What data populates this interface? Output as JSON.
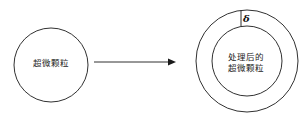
{
  "diagram": {
    "left_particle": {
      "label": "超微颗粒"
    },
    "arrow": {
      "name": "process-arrow"
    },
    "right_particle": {
      "label_line1": "处理后的",
      "label_line2": "超微颗粒",
      "coating_thickness_symbol": "δ"
    },
    "colors": {
      "stroke": "#1a1a1a",
      "background": "#ffffff",
      "text": "#1a1a1a"
    }
  }
}
